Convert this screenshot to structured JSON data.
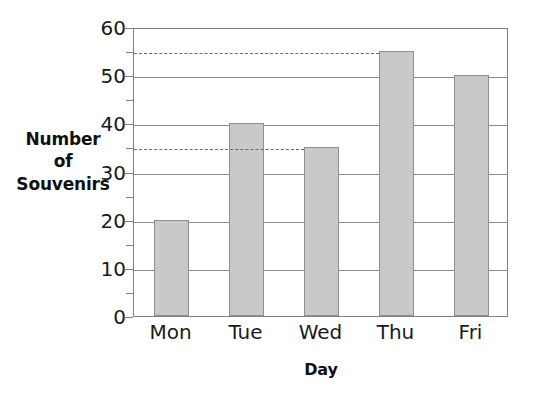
{
  "chart_data": {
    "type": "bar",
    "title": "",
    "xlabel": "Day",
    "ylabel": "Number of Souvenirs",
    "ylabel_lines": [
      "Number",
      "of",
      "Souvenirs"
    ],
    "categories": [
      "Mon",
      "Tue",
      "Wed",
      "Thu",
      "Fri"
    ],
    "values": [
      20,
      40,
      35,
      55,
      50
    ],
    "ylim": [
      0,
      60
    ],
    "ytick_labels": [
      "0",
      "10",
      "20",
      "30",
      "40",
      "50",
      "60"
    ],
    "ytick_values": [
      0,
      10,
      20,
      30,
      40,
      50,
      60
    ],
    "yminor_ticks": [
      5,
      15,
      25,
      35,
      45,
      55
    ],
    "grid": "horizontal-major",
    "legend": "none",
    "annotations": [
      {
        "type": "dashed-reference-line",
        "value": 55,
        "label": "55",
        "extends_to_category": "Thu"
      },
      {
        "type": "dashed-reference-line",
        "value": 35,
        "label": "35",
        "extends_to_category": "Wed"
      }
    ],
    "colors": {
      "bar_fill": "#c9c9c9",
      "bar_stroke": "#8f8f8f",
      "grid": "#8a8a8a",
      "axis": "#808080",
      "dashed": "#6b6b6b",
      "text": "#1a1a1a",
      "background": "#ffffff"
    }
  }
}
